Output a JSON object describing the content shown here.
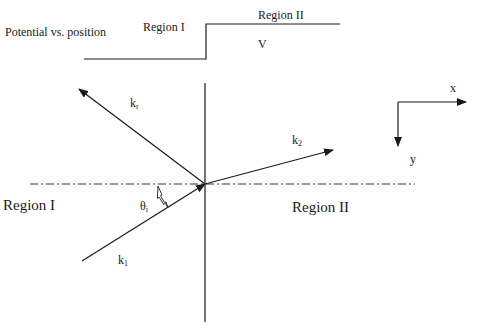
{
  "potential_plot": {
    "title": "Potential vs. position",
    "region1_label": "Region I",
    "region2_label": "Region II",
    "potential_label": "V"
  },
  "wave_diagram": {
    "vectors": {
      "reflected": {
        "base": "k",
        "sub": "r"
      },
      "transmitted": {
        "base": "k",
        "sub": "2"
      },
      "incident": {
        "base": "k",
        "sub": "1"
      }
    },
    "angle": {
      "base": "θ",
      "sub": "i"
    },
    "region_left_label": "Region I",
    "region_right_label": "Region II"
  },
  "axes": {
    "x_label": "x",
    "y_label": "y"
  },
  "colors": {
    "line": "#1a1a1a",
    "background": "#ffffff"
  }
}
